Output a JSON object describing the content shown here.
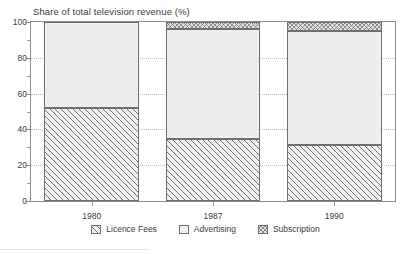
{
  "chart_data": {
    "type": "bar",
    "subtype": "stacked-bar",
    "title": "Share of total television revenue (%)",
    "xlabel": "",
    "ylabel": "",
    "ylim": [
      0,
      100
    ],
    "yticks": [
      0,
      20,
      40,
      60,
      80,
      100
    ],
    "yminorticks": [
      10,
      30,
      50,
      70,
      90
    ],
    "ytick_labels": [
      "0",
      "20",
      "40",
      "60",
      "80",
      "100"
    ],
    "grid": true,
    "grid_axis": "y",
    "legend_position": "bottom",
    "categories": [
      "1980",
      "1987",
      "1990"
    ],
    "series": [
      {
        "name": "Licence Fees",
        "values": [
          52.0,
          34.5,
          31.5
        ],
        "pattern": "diagonal-hatch",
        "color": "#f2f2f2"
      },
      {
        "name": "Advertising",
        "values": [
          48.0,
          61.5,
          63.5
        ],
        "pattern": "solid-light",
        "color": "#eeeeee"
      },
      {
        "name": "Subscription",
        "values": [
          0.0,
          4.0,
          5.0
        ],
        "pattern": "cross-hatch",
        "color": "#e2e2e2"
      }
    ],
    "totals": [
      100,
      100,
      100
    ]
  },
  "axes": {
    "y_ticks": [
      {
        "value": 100,
        "label": "100"
      },
      {
        "value": 80,
        "label": "80"
      },
      {
        "value": 60,
        "label": "60"
      },
      {
        "value": 40,
        "label": "40"
      },
      {
        "value": 20,
        "label": "20"
      },
      {
        "value": 0,
        "label": "0"
      }
    ],
    "x_ticks": [
      {
        "label": "1980"
      },
      {
        "label": "1987"
      },
      {
        "label": "1990"
      }
    ]
  },
  "legend": {
    "items": [
      {
        "label": "Licence Fees"
      },
      {
        "label": "Advertising"
      },
      {
        "label": "Subscription"
      }
    ]
  },
  "colors": {
    "axis": "#8c8c8c",
    "grid": "#bdbdbd",
    "text": "#3c3c3c",
    "bar_outline": "#6f6f6f",
    "licence_fees": "#f2f2f2",
    "advertising": "#eeeeee",
    "subscription": "#e2e2e2"
  }
}
